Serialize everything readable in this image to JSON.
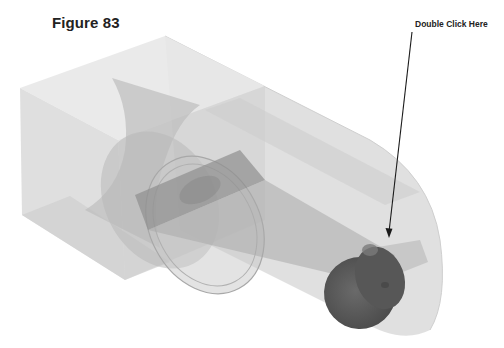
{
  "figure": {
    "caption": "Figure 83",
    "callout_label": "Double Click Here"
  },
  "model": {
    "description": "Transparent 3D part: rectangular block with cylindrical cut, tube with rounded end, inner rod, and dark cylindrical plug",
    "colors": {
      "block_face": "#d9d9d9",
      "block_top": "#e6e6e6",
      "cylinder_shell": "#bdbdbd",
      "rod": "#9a9a9a",
      "plug": "#5e5e5e",
      "arrow": "#1a1a1a"
    }
  }
}
